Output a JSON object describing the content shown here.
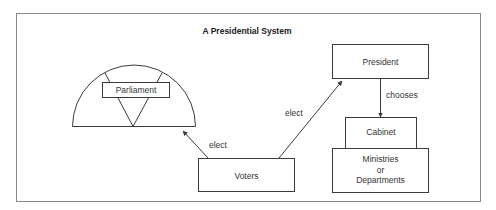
{
  "title": "A Presidential System",
  "nodes": {
    "parliament": "Parliament",
    "president": "President",
    "cabinet": "Cabinet",
    "ministries_line1": "Ministries",
    "ministries_line2": "or",
    "ministries_line3": "Departments",
    "voters": "Voters"
  },
  "edges": {
    "voters_to_parliament": "elect",
    "voters_to_president": "elect",
    "president_to_cabinet": "chooses"
  },
  "colors": {
    "line": "#3a3a3a",
    "frame": "#888888",
    "text": "#333333"
  }
}
